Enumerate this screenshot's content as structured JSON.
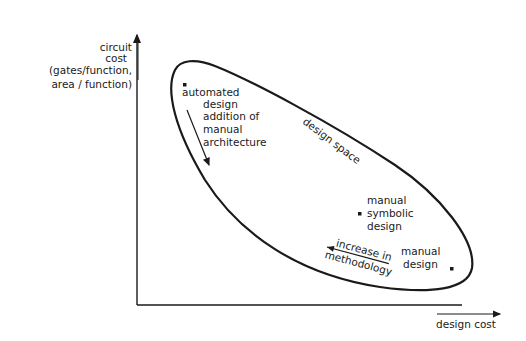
{
  "axes": {
    "y_label_lines": [
      "circuit",
      "cost",
      "(gates/function,",
      "area / function)"
    ],
    "x_label": "design cost"
  },
  "region": {
    "label": "design space"
  },
  "points": [
    {
      "id": "automated",
      "lines": [
        "automated",
        "design",
        "addition of",
        "manual",
        "architecture"
      ]
    },
    {
      "id": "symbolic",
      "lines": [
        "manual",
        "symbolic",
        "design"
      ]
    },
    {
      "id": "manual",
      "lines": [
        "manual",
        "design"
      ]
    }
  ],
  "annotations": {
    "methodology_lines": [
      "increase in",
      "methodology"
    ]
  },
  "colors": {
    "ink": "#1a1a1a",
    "background": "#ffffff"
  }
}
